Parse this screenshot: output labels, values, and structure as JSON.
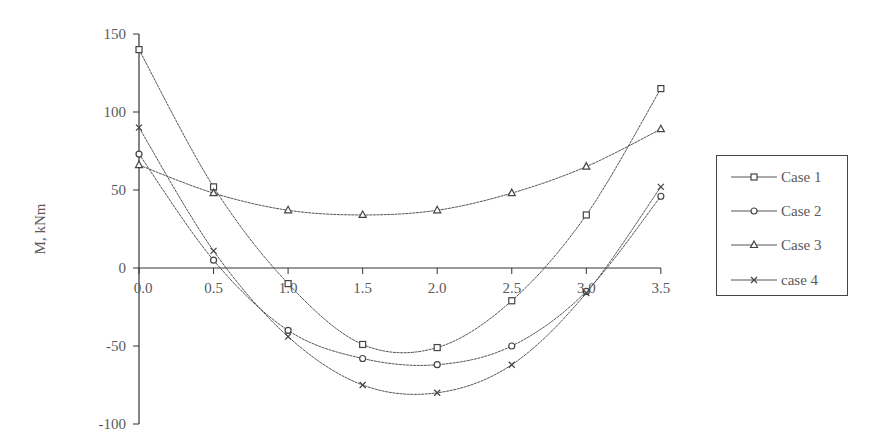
{
  "chart_data": {
    "type": "line",
    "title": "",
    "xlabel": "",
    "ylabel": "M, kNm",
    "x": [
      0.0,
      0.5,
      1.0,
      1.5,
      2.0,
      2.5,
      3.0,
      3.5
    ],
    "x_tick_labels": [
      "0.0",
      "0.5",
      "1.0",
      "1.5",
      "2.0",
      "2.5",
      "3.0",
      "3.5"
    ],
    "y_tick_labels": [
      "150",
      "100",
      "50",
      "0",
      "-50",
      "-100"
    ],
    "y_ticks": [
      150,
      100,
      50,
      0,
      -50,
      -100
    ],
    "ylim": [
      -100,
      150
    ],
    "xlim": [
      0,
      3.5
    ],
    "grid": false,
    "legend_position": "right",
    "series": [
      {
        "name": "Case 1",
        "marker": "square",
        "values": [
          140,
          52,
          -10,
          -49,
          -51,
          -21,
          34,
          115
        ]
      },
      {
        "name": "Case 2",
        "marker": "circle",
        "values": [
          73,
          5,
          -40,
          -58,
          -62,
          -50,
          -15,
          46
        ]
      },
      {
        "name": "Case 3",
        "marker": "triangle",
        "values": [
          66,
          48,
          37,
          34,
          37,
          48,
          65,
          89
        ]
      },
      {
        "name": "case 4",
        "marker": "x",
        "values": [
          90,
          11,
          -44,
          -75,
          -80,
          -62,
          -16,
          52
        ]
      }
    ]
  },
  "legend": {
    "items": [
      {
        "label": "Case 1",
        "marker": "square-icon"
      },
      {
        "label": "Case 2",
        "marker": "circle-icon"
      },
      {
        "label": "Case 3",
        "marker": "triangle-icon"
      },
      {
        "label": "case 4",
        "marker": "x-icon"
      }
    ]
  },
  "colors": {
    "line": "#555555",
    "axis": "#333333",
    "text": "#5a5a5a"
  }
}
